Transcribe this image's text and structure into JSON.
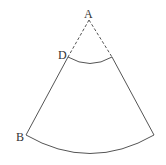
{
  "diagram": {
    "type": "annular-sector",
    "labels": {
      "A": "A",
      "B": "B",
      "D": "D"
    },
    "colors": {
      "stroke": "#555555",
      "label": "#333333",
      "background": "#ffffff"
    },
    "points": {
      "A": [
        89,
        20
      ],
      "D": [
        68,
        57
      ],
      "D_right": [
        112,
        57
      ],
      "B": [
        26,
        135
      ],
      "B_right": [
        154,
        135
      ]
    }
  }
}
